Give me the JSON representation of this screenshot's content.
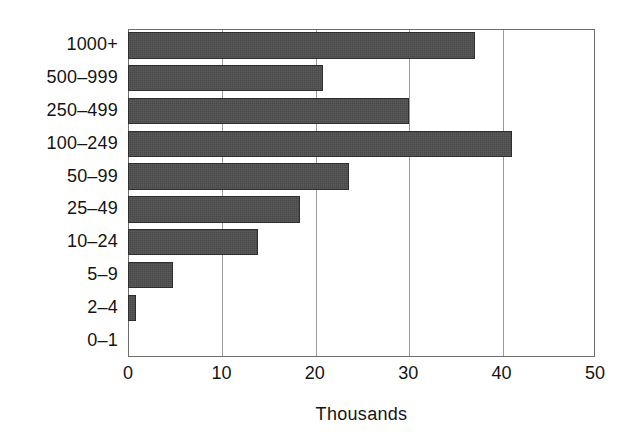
{
  "chart_data": {
    "type": "bar",
    "orientation": "horizontal",
    "title": "",
    "subtitle": "",
    "xlabel": "Thousands",
    "ylabel": "",
    "xlim": [
      0,
      50
    ],
    "xticks": [
      0,
      10,
      20,
      30,
      40,
      50
    ],
    "xtick_labels": [
      "0",
      "10",
      "20",
      "30",
      "40",
      "50"
    ],
    "grid": "vertical",
    "legend": null,
    "legend_position": "none",
    "categories": [
      "1000+",
      "500–999",
      "250–499",
      "100–249",
      "50–99",
      "25–49",
      "10–24",
      "5–9",
      "2–4",
      "0–1"
    ],
    "values": [
      37.1,
      20.9,
      30.1,
      41.1,
      23.7,
      18.4,
      13.9,
      4.8,
      0.9,
      0.0
    ],
    "series": [
      {
        "name": "Thousands",
        "values": [
          37.1,
          20.9,
          30.1,
          41.1,
          23.7,
          18.4,
          13.9,
          4.8,
          0.9,
          0.0
        ]
      }
    ],
    "bar_color": "#484848",
    "bar_edge_color": "#2e2e2e",
    "axis_color": "#6d6d6d",
    "grid_color": "#9a9a9a",
    "background_color": "#ffffff"
  }
}
